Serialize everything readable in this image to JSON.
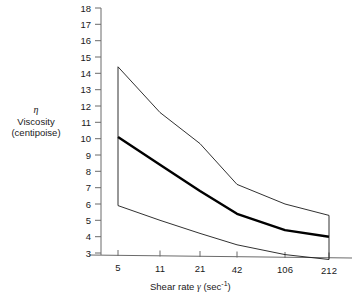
{
  "chart_data": {
    "type": "line",
    "title": "",
    "subtitle": "",
    "xlabel": "Shear rate γ (sec⁻¹)",
    "ylabel_symbol": "η",
    "ylabel_name": "Viscosity",
    "ylabel_units": "(centipoise)",
    "x_tick_labels": [
      "5",
      "11",
      "21",
      "42",
      "106",
      "212"
    ],
    "x_tick_values": [
      5,
      11,
      21,
      42,
      106,
      212
    ],
    "y_tick_labels": [
      "3",
      "4",
      "5",
      "6",
      "7",
      "8",
      "9",
      "10",
      "11",
      "12",
      "13",
      "14",
      "15",
      "16",
      "17",
      "18"
    ],
    "y_tick_values": [
      3,
      4,
      5,
      6,
      7,
      8,
      9,
      10,
      11,
      12,
      13,
      14,
      15,
      16,
      17,
      18
    ],
    "ylim": [
      2.4,
      18
    ],
    "grid": false,
    "legend": "none",
    "series": [
      {
        "name": "Upper bound",
        "style": "thin",
        "color": "#1a1a1a",
        "values": [
          14.4,
          11.6,
          9.7,
          7.2,
          6.0,
          5.3
        ]
      },
      {
        "name": "Mean viscosity",
        "style": "bold",
        "color": "#000000",
        "values": [
          10.1,
          8.4,
          6.8,
          5.4,
          4.4,
          4.0
        ]
      },
      {
        "name": "Lower bound",
        "style": "thin",
        "color": "#1a1a1a",
        "values": [
          5.9,
          5.0,
          4.2,
          3.5,
          2.9,
          2.6
        ]
      }
    ],
    "band_end_caps": [
      {
        "x": 5,
        "y_top": 14.4,
        "y_bottom": 5.9
      },
      {
        "x": 212,
        "y_top": 5.3,
        "y_bottom": 2.6
      }
    ],
    "axis_color": "#6b6b6b"
  }
}
